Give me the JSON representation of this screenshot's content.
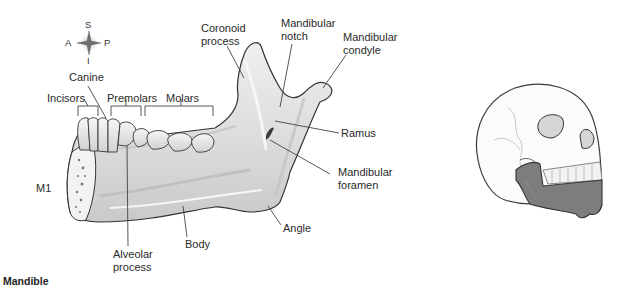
{
  "figure": {
    "title": "Mandible",
    "view_label": "M1"
  },
  "orientation": {
    "superior": "S",
    "inferior": "I",
    "anterior": "A",
    "posterior": "P"
  },
  "labels": {
    "canine": "Canine",
    "incisors": "Incisors",
    "premolars": "Premolars",
    "molars": "Molars",
    "coronoid_process": [
      "Coronoid",
      "process"
    ],
    "mandibular_notch": [
      "Mandibular",
      "notch"
    ],
    "mandibular_condyle": [
      "Mandibular",
      "condyle"
    ],
    "ramus": "Ramus",
    "mandibular_foramen": [
      "Mandibular",
      "foramen"
    ],
    "angle": "Angle",
    "body": "Body",
    "alveolar_process": [
      "Alveolar",
      "process"
    ]
  },
  "colors": {
    "bone_fill": "#e4e4e4",
    "bone_shadow": "#bdbdbd",
    "outline": "#333333",
    "leader": "#444444",
    "highlight_mandible": "#7d7d7d"
  }
}
